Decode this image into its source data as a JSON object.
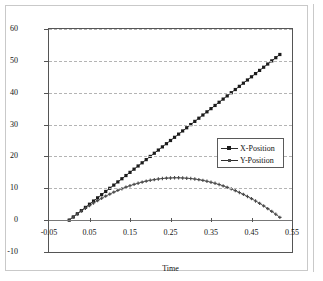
{
  "chart_data": {
    "type": "scatter",
    "title": "",
    "xlabel": "Time",
    "ylabel": "",
    "xlim": [
      -0.05,
      0.55
    ],
    "ylim": [
      -10,
      60
    ],
    "grid": true,
    "legend_position": "inside-right",
    "x_ticks": [
      "-0.05",
      "0.05",
      "0.15",
      "0.25",
      "0.35",
      "0.45",
      "0.55"
    ],
    "x_tick_values": [
      -0.05,
      0.05,
      0.15,
      0.25,
      0.35,
      0.45,
      0.55
    ],
    "y_ticks": [
      "60",
      "50",
      "40",
      "30",
      "20",
      "10",
      "0",
      "-10"
    ],
    "y_tick_values": [
      60,
      50,
      40,
      30,
      20,
      10,
      0,
      -10
    ],
    "x": [
      0,
      0.01,
      0.02,
      0.03,
      0.04,
      0.05,
      0.06,
      0.07,
      0.08,
      0.09,
      0.1,
      0.11,
      0.12,
      0.13,
      0.14,
      0.15,
      0.16,
      0.17,
      0.18,
      0.19,
      0.2,
      0.21,
      0.22,
      0.23,
      0.24,
      0.25,
      0.26,
      0.27,
      0.28,
      0.29,
      0.3,
      0.31,
      0.32,
      0.33,
      0.34,
      0.35,
      0.36,
      0.37,
      0.38,
      0.39,
      0.4,
      0.41,
      0.42,
      0.43,
      0.44,
      0.45,
      0.46,
      0.47,
      0.48,
      0.49,
      0.5,
      0.51,
      0.52
    ],
    "series": [
      {
        "name": "X-Position",
        "marker": "filled-square",
        "color": "#1c1c1c",
        "values": [
          0,
          1,
          2,
          3,
          4,
          5,
          6,
          7,
          8,
          9,
          10,
          11,
          12,
          13,
          14,
          15,
          16,
          17,
          18,
          19,
          20,
          21,
          22,
          23,
          24,
          25,
          26,
          27,
          28,
          29,
          30,
          31,
          32,
          33,
          34,
          35,
          36,
          37,
          38,
          39,
          40,
          41,
          42,
          43,
          44,
          45,
          46,
          47,
          48,
          49,
          50,
          51,
          52
        ]
      },
      {
        "name": "Y-Position",
        "marker": "small-cross",
        "color": "#4a4a4a",
        "values": [
          0,
          1.0,
          1.95,
          2.86,
          3.74,
          4.57,
          5.37,
          6.13,
          6.85,
          7.53,
          8.17,
          8.78,
          9.34,
          9.87,
          10.36,
          10.81,
          11.23,
          11.6,
          11.94,
          12.24,
          12.5,
          12.73,
          12.92,
          13.07,
          13.18,
          13.25,
          13.29,
          13.29,
          13.25,
          13.17,
          13.05,
          12.9,
          12.71,
          12.48,
          12.21,
          11.9,
          11.56,
          11.18,
          10.76,
          10.3,
          9.8,
          9.27,
          8.7,
          8.09,
          7.44,
          6.75,
          6.03,
          5.27,
          4.47,
          3.63,
          2.75,
          1.84,
          0.88
        ]
      }
    ]
  },
  "axis": {
    "x_title": "Time"
  },
  "legend": {
    "entries": [
      {
        "label": "X-Position"
      },
      {
        "label": "Y-Position"
      }
    ]
  },
  "colors": {
    "series_x": "#1c1c1c",
    "series_y": "#4a4a4a",
    "gridline": "#b4b4b4",
    "axis": "#555555",
    "frame": "#c9c9c9",
    "background": "#ffffff"
  }
}
